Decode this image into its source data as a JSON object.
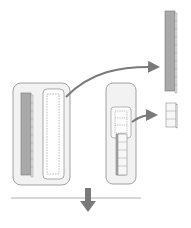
{
  "diagram": {
    "colors": {
      "container_fill": "#f2f2f2",
      "container_stroke": "#8a8a8a",
      "bar_fill": "#a9a9a9",
      "cube_fill": "#f7f7f7",
      "arrow": "#7a7a7a",
      "line": "#9a9a9a"
    },
    "left_group": {
      "filled_bar_cells": 10,
      "dashed_slot_cells": 10
    },
    "middle_group": {
      "dashed_cells": 3,
      "solid_cells": 5
    },
    "right_outputs": {
      "tall_bar_cells": 10,
      "small_stack_cells": 3
    },
    "bottom": {
      "separator_line": true,
      "down_arrow": true
    }
  }
}
